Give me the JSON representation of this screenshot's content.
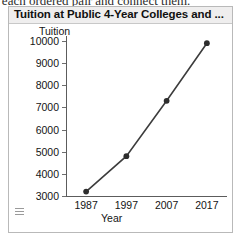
{
  "clipped_text": "t each ordered pair and connect them.",
  "widget": {
    "title": "Tuition at Public 4-Year Colleges and ...",
    "menu_icon": "hamburger-icon"
  },
  "chart_data": {
    "type": "line",
    "title": "Tuition at Public 4-Year Colleges and ...",
    "xlabel": "Year",
    "ylabel": "Tuition",
    "categories": [
      "1987",
      "1997",
      "2007",
      "2017"
    ],
    "x": [
      1987,
      1997,
      2007,
      2017
    ],
    "values": [
      3200,
      4800,
      7300,
      9900
    ],
    "xlim": [
      1982,
      2022
    ],
    "ylim": [
      3000,
      10000
    ],
    "y_ticks": [
      "10000",
      "9000",
      "8000",
      "7000",
      "6000",
      "5000",
      "4000",
      "3000"
    ],
    "y_tick_values": [
      10000,
      9000,
      8000,
      7000,
      6000,
      5000,
      4000,
      3000
    ],
    "x_ticks": [
      "1987",
      "1997",
      "2007",
      "2017"
    ],
    "grid": false,
    "legend": "none",
    "marker": "circle",
    "line_color": "#3c3c3c",
    "marker_color": "#2e2e2e"
  }
}
